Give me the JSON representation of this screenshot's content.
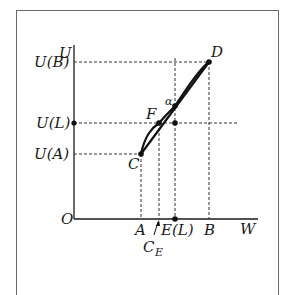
{
  "diagram": {
    "axes": {
      "y_label": "U",
      "x_label": "W",
      "origin_label": "O"
    },
    "y_ticks": [
      {
        "id": "ub",
        "label": "U(B)"
      },
      {
        "id": "ul",
        "label": "U(L)"
      },
      {
        "id": "ua",
        "label": "U(A)"
      }
    ],
    "x_ticks": [
      {
        "id": "a",
        "label": "A"
      },
      {
        "id": "el",
        "label": "E(L)"
      },
      {
        "id": "b",
        "label": "B"
      }
    ],
    "points": {
      "C": "C",
      "D": "D",
      "F": "F",
      "alpha": "α"
    },
    "annotation": {
      "ce_main": "C",
      "ce_sub": "E"
    }
  }
}
